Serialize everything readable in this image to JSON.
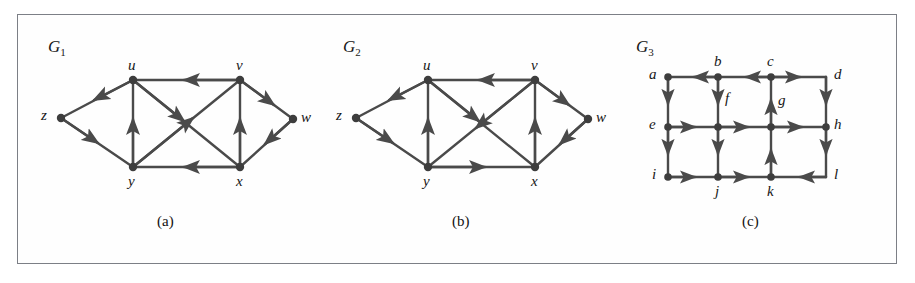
{
  "figure": {
    "background": "#ffffff",
    "border_color": "#7c7f86",
    "ink_color": "#4a4a4a",
    "text_color": "#161616"
  },
  "panels": [
    {
      "id": "a",
      "graph_name": "G",
      "graph_sub": "1",
      "caption": "(a)",
      "vertices": [
        {
          "name": "z",
          "label": "z"
        },
        {
          "name": "u",
          "label": "u"
        },
        {
          "name": "v",
          "label": "v"
        },
        {
          "name": "w",
          "label": "w"
        },
        {
          "name": "y",
          "label": "y"
        },
        {
          "name": "x",
          "label": "x"
        }
      ],
      "edges": [
        {
          "from": "u",
          "to": "z"
        },
        {
          "from": "z",
          "to": "y"
        },
        {
          "from": "y",
          "to": "u"
        },
        {
          "from": "v",
          "to": "u"
        },
        {
          "from": "u",
          "to": "x"
        },
        {
          "from": "y",
          "to": "v"
        },
        {
          "from": "x",
          "to": "v"
        },
        {
          "from": "x",
          "to": "y"
        },
        {
          "from": "v",
          "to": "w"
        },
        {
          "from": "w",
          "to": "x"
        }
      ]
    },
    {
      "id": "b",
      "graph_name": "G",
      "graph_sub": "2",
      "caption": "(b)",
      "vertices": [
        {
          "name": "z",
          "label": "z"
        },
        {
          "name": "u",
          "label": "u"
        },
        {
          "name": "v",
          "label": "v"
        },
        {
          "name": "w",
          "label": "w"
        },
        {
          "name": "y",
          "label": "y"
        },
        {
          "name": "x",
          "label": "x"
        }
      ],
      "edges": [
        {
          "from": "u",
          "to": "z"
        },
        {
          "from": "z",
          "to": "y"
        },
        {
          "from": "y",
          "to": "u"
        },
        {
          "from": "v",
          "to": "u"
        },
        {
          "from": "u",
          "to": "x"
        },
        {
          "from": "v",
          "to": "y"
        },
        {
          "from": "x",
          "to": "v"
        },
        {
          "from": "y",
          "to": "x"
        },
        {
          "from": "v",
          "to": "w"
        },
        {
          "from": "w",
          "to": "x"
        }
      ]
    },
    {
      "id": "c",
      "graph_name": "G",
      "graph_sub": "3",
      "caption": "(c)",
      "vertices": [
        {
          "name": "a",
          "label": "a"
        },
        {
          "name": "b",
          "label": "b"
        },
        {
          "name": "c",
          "label": "c"
        },
        {
          "name": "d",
          "label": "d"
        },
        {
          "name": "e",
          "label": "e"
        },
        {
          "name": "f",
          "label": "f"
        },
        {
          "name": "g",
          "label": "g"
        },
        {
          "name": "h",
          "label": "h"
        },
        {
          "name": "i",
          "label": "i"
        },
        {
          "name": "j",
          "label": "j"
        },
        {
          "name": "k",
          "label": "k"
        },
        {
          "name": "l",
          "label": "l"
        }
      ],
      "edges": [
        {
          "from": "b",
          "to": "a"
        },
        {
          "from": "c",
          "to": "b"
        },
        {
          "from": "c",
          "to": "d"
        },
        {
          "from": "a",
          "to": "e"
        },
        {
          "from": "b",
          "to": "f"
        },
        {
          "from": "g",
          "to": "c"
        },
        {
          "from": "d",
          "to": "h"
        },
        {
          "from": "e",
          "to": "f"
        },
        {
          "from": "f",
          "to": "g"
        },
        {
          "from": "g",
          "to": "h"
        },
        {
          "from": "e",
          "to": "i"
        },
        {
          "from": "f",
          "to": "j"
        },
        {
          "from": "k",
          "to": "g"
        },
        {
          "from": "h",
          "to": "l"
        },
        {
          "from": "i",
          "to": "j"
        },
        {
          "from": "j",
          "to": "k"
        },
        {
          "from": "l",
          "to": "k"
        }
      ]
    }
  ]
}
